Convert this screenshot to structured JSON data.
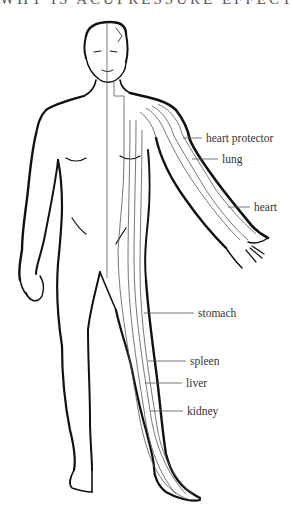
{
  "title": "WHY IS ACUPRESSURE EFFECTIVE",
  "diagram": {
    "labels": [
      {
        "id": "heart-protector",
        "text": "heart protector"
      },
      {
        "id": "lung",
        "text": "lung"
      },
      {
        "id": "heart",
        "text": "heart"
      },
      {
        "id": "stomach",
        "text": "stomach"
      },
      {
        "id": "spleen",
        "text": "spleen"
      },
      {
        "id": "liver",
        "text": "liver"
      },
      {
        "id": "kidney",
        "text": "kidney"
      }
    ]
  },
  "colors": {
    "outline": "#111111",
    "meridian": "#555555",
    "text": "#333333"
  }
}
